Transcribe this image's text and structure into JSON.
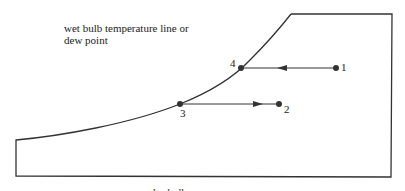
{
  "diagram": {
    "annotation_line1": "wet bulb temperature line or",
    "annotation_line2": "dew point",
    "points": [
      {
        "id": "1",
        "label": "1"
      },
      {
        "id": "2",
        "label": "2"
      },
      {
        "id": "3",
        "label": "3"
      },
      {
        "id": "4",
        "label": "4"
      }
    ],
    "bottom_label_partial": "dry bulb",
    "colors": {
      "line": "#333333",
      "background": "#ffffff"
    }
  }
}
